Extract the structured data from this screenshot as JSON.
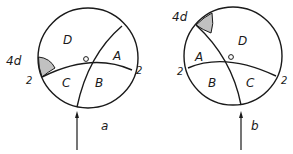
{
  "colors": {
    "ink": "#1a1a1a",
    "background": "#ffffff",
    "shade": "#8a8a8a"
  },
  "figures": [
    {
      "id": "a",
      "caption": "a",
      "regions": [
        "D",
        "A",
        "C",
        "B"
      ],
      "shaded_label": "4d",
      "edge_labels": [
        "2",
        "2"
      ]
    },
    {
      "id": "b",
      "caption": "b",
      "regions": [
        "D",
        "A",
        "B",
        "C"
      ],
      "shaded_label": "4d",
      "edge_labels": [
        "2",
        "2"
      ]
    }
  ]
}
